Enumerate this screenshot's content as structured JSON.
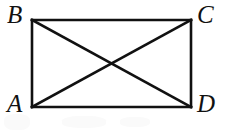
{
  "figure": {
    "type": "geometry-diagram",
    "shape_name": "rectangle-with-diagonals",
    "background_color": "#ffffff",
    "stroke_color": "#111111",
    "stroke_width": 2.6,
    "labels": {
      "top_left": "B",
      "top_right": "C",
      "bottom_left": "A",
      "bottom_right": "D"
    },
    "vertices": {
      "A": {
        "x": 32,
        "y": 107
      },
      "B": {
        "x": 32,
        "y": 20
      },
      "C": {
        "x": 191,
        "y": 20
      },
      "D": {
        "x": 191,
        "y": 107
      }
    },
    "edges": [
      {
        "name": "BC",
        "from": "B",
        "to": "C"
      },
      {
        "name": "CD",
        "from": "C",
        "to": "D"
      },
      {
        "name": "DA",
        "from": "D",
        "to": "A"
      },
      {
        "name": "AB",
        "from": "A",
        "to": "B"
      }
    ],
    "diagonals": [
      {
        "name": "BD",
        "from": "B",
        "to": "D"
      },
      {
        "name": "AC",
        "from": "A",
        "to": "C"
      }
    ],
    "diagonal_intersection": {
      "x": 111.5,
      "y": 63.5
    }
  }
}
